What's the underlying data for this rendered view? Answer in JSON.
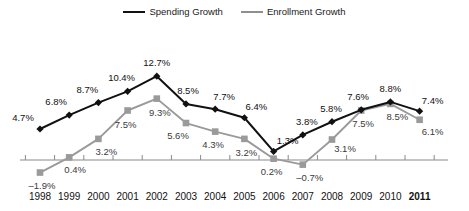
{
  "chart_data": {
    "type": "line",
    "title": "",
    "subtitle": "",
    "xlabel": "",
    "ylabel": "",
    "grid": false,
    "legend_position": "top-center",
    "categories": [
      "1998",
      "1999",
      "2000",
      "2001",
      "2002",
      "2003",
      "2004",
      "2005",
      "2006",
      "2007",
      "2008",
      "2009",
      "2010",
      "2011"
    ],
    "ylim": [
      -3.5,
      14.5
    ],
    "zero_line": 0,
    "value_suffix": "%",
    "series": [
      {
        "name": "Spending Growth",
        "color": "#111111",
        "marker": "diamond",
        "values": [
          4.7,
          6.8,
          8.7,
          10.4,
          12.7,
          8.5,
          7.7,
          6.4,
          1.3,
          3.8,
          5.8,
          7.6,
          8.8,
          7.4
        ],
        "labels": [
          "4.7%",
          "6.8%",
          "8.7%",
          "10.4%",
          "12.7%",
          "8.5%",
          "7.7%",
          "6.4%",
          "1.3%",
          "3.8%",
          "5.8%",
          "7.6%",
          "8.8%",
          "7.4%"
        ]
      },
      {
        "name": "Enrollment Growth",
        "color": "#9a9a9a",
        "marker": "square",
        "values": [
          -1.9,
          0.4,
          3.2,
          7.5,
          9.3,
          5.6,
          4.3,
          3.2,
          0.2,
          -0.7,
          3.1,
          7.5,
          8.5,
          6.1
        ],
        "labels": [
          "–1.9%",
          "0.4%",
          "3.2%",
          "7.5%",
          "9.3%",
          "5.6%",
          "4.3%",
          "3.2%",
          "0.2%",
          "–0.7%",
          "3.1%",
          "7.5%",
          "8.5%",
          "6.1%"
        ]
      }
    ]
  },
  "legend": {
    "entries": [
      {
        "label": "Spending Growth",
        "marker": "diamond-marker",
        "color": "#111111"
      },
      {
        "label": "Enrollment Growth",
        "marker": "square-marker",
        "color": "#9a9a9a"
      }
    ]
  },
  "axis": {
    "x_tick_labels": [
      "1998",
      "1999",
      "2000",
      "2001",
      "2002",
      "2003",
      "2004",
      "2005",
      "2006",
      "2007",
      "2008",
      "2009",
      "2010",
      "2011"
    ],
    "x_bold_index": 13,
    "axis_color": "#8a8a8a"
  },
  "label_offsets": {
    "spending": [
      {
        "dx": -17,
        "dy": -11
      },
      {
        "dx": -13,
        "dy": -13
      },
      {
        "dx": -11,
        "dy": -13
      },
      {
        "dx": -6,
        "dy": -13
      },
      {
        "dx": 0,
        "dy": -13
      },
      {
        "dx": 2,
        "dy": -13
      },
      {
        "dx": 9,
        "dy": -12
      },
      {
        "dx": 12,
        "dy": -11
      },
      {
        "dx": 14,
        "dy": -10
      },
      {
        "dx": 4,
        "dy": -13
      },
      {
        "dx": -1,
        "dy": -13
      },
      {
        "dx": -3,
        "dy": -13
      },
      {
        "dx": 0,
        "dy": -13
      },
      {
        "dx": 13,
        "dy": -10
      }
    ],
    "enrollment": [
      {
        "dx": 2,
        "dy": 13
      },
      {
        "dx": 6,
        "dy": 13
      },
      {
        "dx": 8,
        "dy": 13
      },
      {
        "dx": -2,
        "dy": 14
      },
      {
        "dx": 3,
        "dy": 14
      },
      {
        "dx": -8,
        "dy": 13
      },
      {
        "dx": -2,
        "dy": 13
      },
      {
        "dx": 2,
        "dy": 14
      },
      {
        "dx": -2,
        "dy": 13
      },
      {
        "dx": 7,
        "dy": 13
      },
      {
        "dx": 13,
        "dy": 9
      },
      {
        "dx": 2,
        "dy": 13
      },
      {
        "dx": 7,
        "dy": 13
      },
      {
        "dx": 13,
        "dy": 12
      }
    ]
  }
}
